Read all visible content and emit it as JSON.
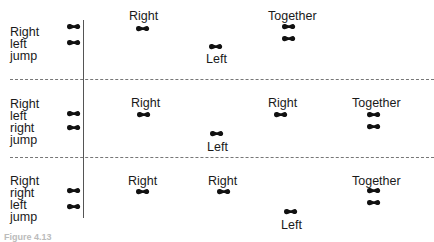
{
  "rows": [
    {
      "sequence": [
        "Right",
        "left",
        "jump"
      ],
      "steps": [
        {
          "label": "Right",
          "x": 143,
          "y": 27,
          "label_pos": "above"
        },
        {
          "label": "Left",
          "x": 215,
          "y": 46,
          "label_pos": "below"
        },
        {
          "label": "Together",
          "x": 289,
          "y": 27,
          "label_pos": "above",
          "pair": true
        }
      ],
      "start_feet_y": [
        27,
        42
      ]
    },
    {
      "sequence": [
        "Right",
        "left",
        "right",
        "jump"
      ],
      "steps": [
        {
          "label": "Right",
          "x": 143,
          "y": 112,
          "label_pos": "above"
        },
        {
          "label": "Left",
          "x": 215,
          "y": 132,
          "label_pos": "below"
        },
        {
          "label": "Right",
          "x": 281,
          "y": 112,
          "label_pos": "above"
        },
        {
          "label": "Together",
          "x": 374,
          "y": 112,
          "label_pos": "above",
          "pair": true
        }
      ],
      "start_feet_y": [
        112,
        127
      ]
    },
    {
      "sequence": [
        "Right",
        "right",
        "left",
        "jump"
      ],
      "steps": [
        {
          "label": "Right",
          "x": 143,
          "y": 189,
          "label_pos": "above"
        },
        {
          "label": "Right",
          "x": 223,
          "y": 189,
          "label_pos": "above"
        },
        {
          "label": "Left",
          "x": 290,
          "y": 211,
          "label_pos": "below"
        },
        {
          "label": "Together",
          "x": 374,
          "y": 189,
          "label_pos": "above",
          "pair": true
        }
      ],
      "start_feet_y": [
        189,
        206
      ]
    }
  ],
  "text": {
    "r1_seq_0": "Right",
    "r1_seq_1": "left",
    "r1_seq_2": "jump",
    "r1_s1": "Right",
    "r1_s2": "Left",
    "r1_s3": "Together",
    "r2_seq_0": "Right",
    "r2_seq_1": "left",
    "r2_seq_2": "right",
    "r2_seq_3": "jump",
    "r2_s1": "Right",
    "r2_s2": "Left",
    "r2_s3": "Right",
    "r2_s4": "Together",
    "r3_seq_0": "Right",
    "r3_seq_1": "right",
    "r3_seq_2": "left",
    "r3_seq_3": "jump",
    "r3_s1": "Right",
    "r3_s2": "Right",
    "r3_s3": "Left",
    "r3_s4": "Together",
    "caption": "Figure 4.13"
  },
  "icons": {
    "footprint": "footprint-icon"
  },
  "colors": {
    "ink": "#1a1a1a",
    "divider": "#777777",
    "axis": "#555555"
  }
}
